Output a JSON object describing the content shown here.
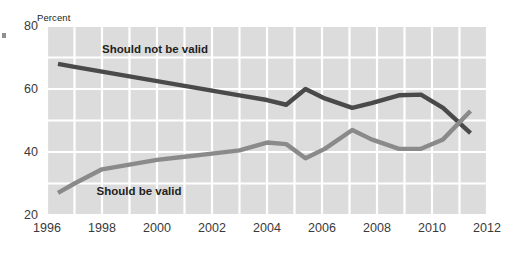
{
  "chart_data": {
    "type": "line",
    "title": "",
    "subtitle": "",
    "xlabel": "",
    "ylabel": "Percent",
    "ylim": [
      20,
      80
    ],
    "xlim": [
      1996,
      2012
    ],
    "grid": true,
    "gridlines": {
      "y_major": [
        20,
        40,
        60,
        80
      ],
      "y_minor": [
        30,
        50,
        70
      ],
      "x_every": 1
    },
    "legend_position": "inline-annotations",
    "y_ticklabels": [
      "80",
      "60",
      "40",
      "20"
    ],
    "x_ticklabels": [
      "1996",
      "1998",
      "2000",
      "2002",
      "2004",
      "2006",
      "2008",
      "2010",
      "2012"
    ],
    "series": [
      {
        "name": "Should not be valid",
        "color": "#4a4a4a",
        "x": [
          1996.4,
          1997,
          1998,
          1999,
          2000,
          2001,
          2002,
          2003,
          2004,
          2004.7,
          2005.4,
          2006.1,
          2007.1,
          2007.8,
          2008.8,
          2009.6,
          2010.4,
          2011.4
        ],
        "values": [
          68,
          67,
          65.5,
          64,
          62.5,
          61,
          59.5,
          58,
          56.5,
          55,
          60,
          57,
          54,
          55.5,
          58,
          58.2,
          54,
          46
        ]
      },
      {
        "name": "Should be valid",
        "color": "#8a8a8a",
        "x": [
          1996.4,
          1997,
          1998,
          1999,
          2000,
          2001,
          2002,
          2003,
          2004,
          2004.7,
          2005.4,
          2006.1,
          2007.1,
          2007.8,
          2008.8,
          2009.6,
          2010.4,
          2011.4
        ],
        "values": [
          27,
          30,
          34.5,
          36,
          37.5,
          38.5,
          39.5,
          40.5,
          43,
          42.5,
          38,
          41,
          47,
          44,
          41,
          41,
          44,
          53
        ]
      }
    ],
    "annotations": [
      {
        "text": "Should not be valid",
        "x": 1998.0,
        "y": 71.5,
        "bold": true,
        "color": "#231f20"
      },
      {
        "text": "Should be valid",
        "x": 1997.8,
        "y": 26.5,
        "bold": true,
        "color": "#231f20"
      }
    ]
  },
  "axis": {
    "y_title": "Percent",
    "y_ticks": [
      {
        "label": "80",
        "value": 80
      },
      {
        "label": "60",
        "value": 60
      },
      {
        "label": "40",
        "value": 40
      },
      {
        "label": "20",
        "value": 20
      }
    ],
    "x_ticks": [
      {
        "label": "1996",
        "value": 1996
      },
      {
        "label": "1998",
        "value": 1998
      },
      {
        "label": "2000",
        "value": 2000
      },
      {
        "label": "2002",
        "value": 2002
      },
      {
        "label": "2004",
        "value": 2004
      },
      {
        "label": "2006",
        "value": 2006
      },
      {
        "label": "2008",
        "value": 2008
      },
      {
        "label": "2010",
        "value": 2010
      },
      {
        "label": "2012",
        "value": 2012
      }
    ]
  },
  "style": {
    "plot_background": "#dcdcdc",
    "gridline_color": "#ffffff",
    "page_background": "#ffffff",
    "dark_series_color": "#4a4a4a",
    "light_series_color": "#8a8a8a",
    "tick_text_color": "#3a3a3a",
    "annotation_text_color": "#231f20"
  }
}
